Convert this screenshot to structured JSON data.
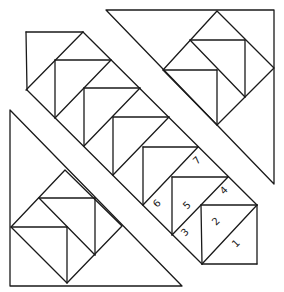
{
  "diagram": {
    "type": "quilt-block-piecing-diagram",
    "line_color": "#1a1a1a",
    "background": "#ffffff",
    "piece_labels": [
      {
        "label": "1",
        "x": 236,
        "y": 246,
        "rotate": -45
      },
      {
        "label": "2",
        "x": 219,
        "y": 224,
        "rotate": -45
      },
      {
        "label": "3",
        "x": 187,
        "y": 235,
        "rotate": -45
      },
      {
        "label": "4",
        "x": 227,
        "y": 193,
        "rotate": -45
      },
      {
        "label": "5",
        "x": 190,
        "y": 208,
        "rotate": -45
      },
      {
        "label": "6",
        "x": 161,
        "y": 207,
        "rotate": -45
      },
      {
        "label": "7",
        "x": 200,
        "y": 163,
        "rotate": -45
      }
    ],
    "sections": [
      "upper-right-corner-triangle",
      "center-diagonal-band",
      "lower-left-corner-triangle"
    ]
  }
}
